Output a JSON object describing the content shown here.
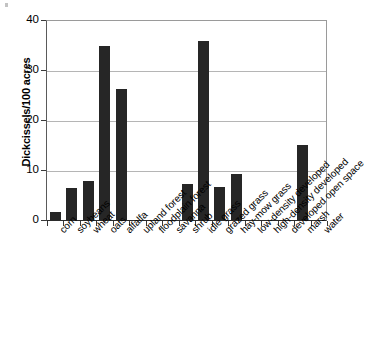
{
  "chart_data": {
    "type": "bar",
    "title": "",
    "subtitle": "",
    "xlabel": "",
    "ylabel": "Dickcissels/100 acres",
    "ylim": [
      0,
      40
    ],
    "yticks": [
      0,
      10,
      20,
      30,
      40
    ],
    "grid": true,
    "legend": null,
    "orientation": "vertical",
    "bar_color": "#262626",
    "categories": [
      "corn",
      "soybeans",
      "wheat",
      "oats",
      "alfalfa",
      "upland forest",
      "floodplain forest",
      "savanna",
      "shrub",
      "idle grass",
      "grazed grass",
      "hay-mow grass",
      "low-density developed",
      "high-density developed",
      "developed open space",
      "marsh",
      "water"
    ],
    "values": [
      1.6,
      6.5,
      7.9,
      34.8,
      26.2,
      0,
      0,
      0,
      7.2,
      35.8,
      6.7,
      9.2,
      0,
      0,
      0,
      15.0,
      0
    ]
  },
  "axis": {
    "y_tick_labels": [
      "0",
      "10",
      "20",
      "30",
      "40"
    ],
    "y_title": "Dickcissels/100 acres"
  }
}
